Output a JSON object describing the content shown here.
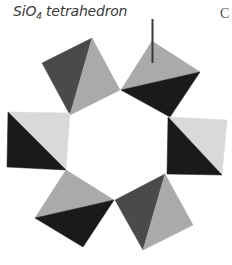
{
  "label": {
    "prefix": "SiO",
    "subscript": "4",
    "suffix": " tetrahedron"
  },
  "panel_letter": "C",
  "colors": {
    "light": "#c8c8c8",
    "lighter": "#d9d9d9",
    "mid": "#aaaaaa",
    "dark": "#4a4a4a",
    "black": "#1a1a1a",
    "pointer": "#3a3a3a"
  },
  "tetrahedra": [
    {
      "name": "top-left",
      "faces": [
        {
          "points": "42,63 92,38 70,115",
          "fill": "dark"
        },
        {
          "points": "92,38 120,90 70,115",
          "fill": "mid"
        }
      ]
    },
    {
      "name": "top-right",
      "faces": [
        {
          "points": "121,90 152,41 200,72",
          "fill": "mid"
        },
        {
          "points": "121,90 200,72 170,117",
          "fill": "black"
        }
      ]
    },
    {
      "name": "right",
      "faces": [
        {
          "points": "168,117 227,120 222,175",
          "fill": "lighter"
        },
        {
          "points": "168,117 222,175 167,174",
          "fill": "black"
        }
      ]
    },
    {
      "name": "bottom-right",
      "faces": [
        {
          "points": "115,200 165,174 143,250",
          "fill": "dark"
        },
        {
          "points": "165,174 193,225 143,250",
          "fill": "mid"
        }
      ]
    },
    {
      "name": "bottom-left",
      "faces": [
        {
          "points": "35,218 66,170 114,200",
          "fill": "mid"
        },
        {
          "points": "35,218 114,200 83,247",
          "fill": "black"
        }
      ]
    },
    {
      "name": "left",
      "faces": [
        {
          "points": "8,112 70,113 66,170",
          "fill": "lighter"
        },
        {
          "points": "8,112 66,170 7,167",
          "fill": "black"
        }
      ]
    }
  ],
  "pointer": {
    "x1": 152.5,
    "y1": 19,
    "x2": 152.5,
    "y2": 63
  }
}
